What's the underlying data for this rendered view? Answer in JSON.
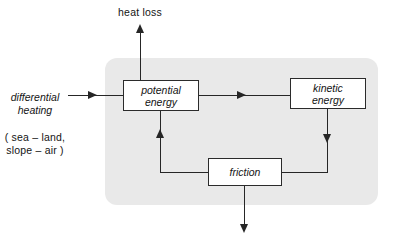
{
  "diagram": {
    "panel": {
      "name": "system-boundary",
      "fill_color": "#e9e9e9"
    },
    "nodes": [
      {
        "id": "potential-energy",
        "label": "potential\nenergy",
        "style": "italic"
      },
      {
        "id": "kinetic-energy",
        "label": "kinetic\nenergy",
        "style": "italic"
      },
      {
        "id": "friction",
        "label": "friction",
        "style": "italic"
      }
    ],
    "labels": {
      "heat_loss": "heat  loss",
      "input_title": "differential\nheating",
      "input_detail": "( sea – land,\nslope – air )"
    },
    "arrows": [
      {
        "id": "input-to-potential",
        "from": "differential heating",
        "to": "potential energy",
        "direction": "right"
      },
      {
        "id": "potential-to-heat-loss",
        "from": "potential energy",
        "to": "heat loss",
        "direction": "up"
      },
      {
        "id": "potential-to-kinetic",
        "from": "potential energy",
        "to": "kinetic energy",
        "direction": "right"
      },
      {
        "id": "kinetic-to-friction",
        "from": "kinetic energy",
        "to": "friction",
        "direction": "down"
      },
      {
        "id": "friction-to-potential",
        "from": "friction",
        "to": "potential energy",
        "direction": "up"
      },
      {
        "id": "friction-output",
        "from": "friction",
        "to": "output",
        "direction": "down"
      }
    ],
    "colors": {
      "stroke": "#262626",
      "box_fill": "#ffffff",
      "panel_fill": "#e9e9e9",
      "text": "#141414"
    }
  }
}
